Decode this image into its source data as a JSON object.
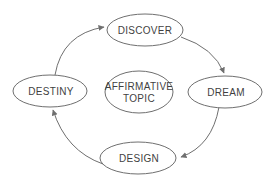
{
  "diagram": {
    "type": "cycle",
    "nodes": {
      "discover": {
        "label": "DISCOVER"
      },
      "dream": {
        "label": "DREAM"
      },
      "design": {
        "label": "DESIGN"
      },
      "destiny": {
        "label": "DESTINY"
      },
      "affirmative_topic": {
        "line1": "AFFIRMATIVE",
        "line2": "TOPIC"
      }
    },
    "edges": [
      {
        "from": "DESTINY",
        "to": "DISCOVER"
      },
      {
        "from": "DISCOVER",
        "to": "DREAM"
      },
      {
        "from": "DREAM",
        "to": "DESIGN"
      },
      {
        "from": "DESIGN",
        "to": "DESTINY"
      }
    ],
    "colors": {
      "background": "#ffffff",
      "line": "#6f6f6f",
      "text": "#3f3f3f"
    }
  }
}
